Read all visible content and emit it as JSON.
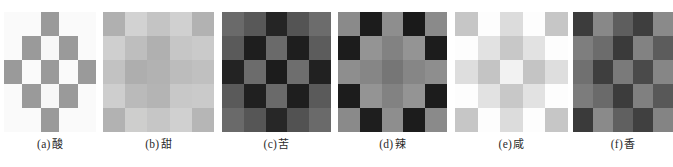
{
  "figure": {
    "panel_count": 6,
    "grid_rows": 5,
    "grid_cols": 5,
    "background_color": "#ffffff",
    "caption_color": "#2b2b2b"
  },
  "panels": [
    {
      "id": "panel-a",
      "caption_index": "(a)",
      "caption_word": "酸",
      "caption_full": "（a）酸",
      "x": 4,
      "y": 12,
      "width": 92,
      "height": 120,
      "caption_y": 144,
      "palette": {
        "light": "#fafafa",
        "dark": "#9a9a9a"
      },
      "cells": [
        "#fafafa",
        "#fafafa",
        "#9a9a9a",
        "#fafafa",
        "#fafafa",
        "#fafafa",
        "#9a9a9a",
        "#f7f7f7",
        "#9a9a9a",
        "#fafafa",
        "#9a9a9a",
        "#fafafa",
        "#9a9a9a",
        "#fafafa",
        "#9a9a9a",
        "#fafafa",
        "#9a9a9a",
        "#f7f7f7",
        "#9a9a9a",
        "#fafafa",
        "#fafafa",
        "#fafafa",
        "#9a9a9a",
        "#fafafa",
        "#fafafa"
      ]
    },
    {
      "id": "panel-b",
      "caption_index": "(b)",
      "caption_word": "甜",
      "caption_full": "（b）甜",
      "x": 103,
      "y": 12,
      "width": 111,
      "height": 120,
      "caption_y": 144,
      "palette": {
        "light": "#d2d2d2",
        "dark": "#b4b4b4"
      },
      "cells": [
        "#b0b0b0",
        "#d2d2d2",
        "#c4c4c4",
        "#d0d0d0",
        "#b2b2b2",
        "#cfcfcf",
        "#bebebe",
        "#b0b0b0",
        "#c6c6c6",
        "#cacaca",
        "#c2c2c2",
        "#aeaeae",
        "#b2b2b2",
        "#bcbcbc",
        "#c0c0c0",
        "#cecece",
        "#bababa",
        "#b4b4b4",
        "#c8c8c8",
        "#cacaca",
        "#b2b2b2",
        "#cececd",
        "#c6c6c6",
        "#d0d0d0",
        "#b6b6b6"
      ]
    },
    {
      "id": "panel-c",
      "caption_index": "(c)",
      "caption_word": "苦",
      "caption_full": "（c）苦",
      "x": 222,
      "y": 12,
      "width": 109,
      "height": 120,
      "caption_y": 144,
      "palette": {
        "light": "#6e6e6e",
        "dark": "#1c1c1c"
      },
      "cells": [
        "#6a6a6a",
        "#585858",
        "#252525",
        "#545454",
        "#6c6c6c",
        "#5a5a5a",
        "#1e1e1e",
        "#6a6a6a",
        "#1e1e1e",
        "#5c5c5c",
        "#232323",
        "#6c6c6c",
        "#1c1c1c",
        "#6e6e6e",
        "#212121",
        "#5a5a5a",
        "#202020",
        "#6a6a6a",
        "#1e1e1e",
        "#5a5a5a",
        "#6a6a6a",
        "#565656",
        "#272727",
        "#525252",
        "#6a6a6a"
      ]
    },
    {
      "id": "panel-d",
      "caption_index": "(d)",
      "caption_word": "辣",
      "caption_full": "（d）辣",
      "x": 338,
      "y": 12,
      "width": 109,
      "height": 120,
      "caption_y": 144,
      "palette": {
        "light": "#8e8e8e",
        "dark": "#1a1a1a"
      },
      "cells": [
        "#8a8a8a",
        "#1c1c1c",
        "#8e8e8e",
        "#1a1a1a",
        "#8a8a8a",
        "#1c1c1c",
        "#949494",
        "#828282",
        "#949494",
        "#1c1c1c",
        "#8e8e8e",
        "#868686",
        "#767676",
        "#868686",
        "#8e8e8e",
        "#1c1c1c",
        "#949494",
        "#828282",
        "#949494",
        "#1c1c1c",
        "#8a8a8a",
        "#1e1e1e",
        "#8e8e8e",
        "#1c1c1c",
        "#8a8a8a"
      ]
    },
    {
      "id": "panel-e",
      "caption_index": "(e)",
      "caption_word": "咸",
      "caption_full": "（e）咸",
      "x": 455,
      "y": 12,
      "width": 113,
      "height": 120,
      "caption_y": 144,
      "palette": {
        "light": "#fdfdfd",
        "dark": "#c4c4c4"
      },
      "cells": [
        "#c6c6c6",
        "#fdfdfd",
        "#dcdcdc",
        "#fdfdfd",
        "#c6c6c6",
        "#fdfdfd",
        "#e2e2e2",
        "#c8c8c8",
        "#e2e2e2",
        "#fdfdfd",
        "#dedede",
        "#c4c4c4",
        "#f2f2f2",
        "#c4c4c4",
        "#dedede",
        "#fdfdfd",
        "#e2e2e2",
        "#c8c8c8",
        "#e2e2e2",
        "#fdfdfd",
        "#c6c6c6",
        "#fdfdfd",
        "#dcdcdc",
        "#fdfdfd",
        "#c6c6c6"
      ]
    },
    {
      "id": "panel-f",
      "caption_index": "(f)",
      "caption_word": "香",
      "caption_full": "（f）香",
      "x": 573,
      "y": 12,
      "width": 100,
      "height": 120,
      "caption_y": 144,
      "clipped": true,
      "palette": {
        "light": "#8a8a8a",
        "dark": "#3a3a3a"
      },
      "cells": [
        "#3c3c3c",
        "#888888",
        "#5e5e5e",
        "#3e3e3e",
        "#8a8a8a",
        "#7e7e7e",
        "#6c6c6c",
        "#3a3a3a",
        "#828282",
        "#5c5c5c",
        "#707070",
        "#3e3e3e",
        "#7a7a7a",
        "#4a4a4a",
        "#868686",
        "#7c7c7c",
        "#6a6a6a",
        "#3c3c3c",
        "#808080",
        "#585858",
        "#3a3a3a",
        "#8a8a8a",
        "#606060",
        "#404040",
        "#848484"
      ]
    }
  ]
}
